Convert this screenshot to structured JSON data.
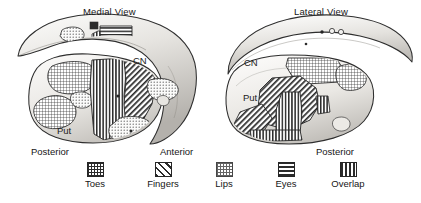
{
  "figure": {
    "type": "anatomical-diagram"
  },
  "views": [
    {
      "id": "medial",
      "title": "Medial View",
      "structures": [
        {
          "abbr": "CN",
          "name": "Caudate Nucleus"
        },
        {
          "abbr": "Put",
          "name": "Putamen"
        }
      ],
      "orientation": {
        "left": "Posterior",
        "right": "Anterior"
      }
    },
    {
      "id": "lateral",
      "title": "Lateral View",
      "structures": [
        {
          "abbr": "CN",
          "name": "Caudate Nucleus"
        },
        {
          "abbr": "Put",
          "name": "Putamen"
        }
      ],
      "orientation": {
        "right": "Posterior"
      }
    }
  ],
  "orientation_labels": {
    "posterior_left": "Posterior",
    "anterior": "Anterior",
    "posterior_right": "Posterior"
  },
  "legend": {
    "items": [
      {
        "key": "toes",
        "label": "Toes",
        "pattern": "grid",
        "swatch_class": "sw-grid"
      },
      {
        "key": "fingers",
        "label": "Fingers",
        "pattern": "diagonal",
        "swatch_class": "sw-diag"
      },
      {
        "key": "lips",
        "label": "Lips",
        "pattern": "fine-dots",
        "swatch_class": "sw-dots"
      },
      {
        "key": "eyes",
        "label": "Eyes",
        "pattern": "horizontal",
        "swatch_class": "sw-horiz"
      },
      {
        "key": "overlap",
        "label": "Overlap",
        "pattern": "vertical",
        "swatch_class": "sw-vert"
      }
    ]
  },
  "colors": {
    "ink": "#1a1a1a",
    "outline": "#262626",
    "pattern": "#2b2b2b",
    "tissue_light": "#f2f1ef",
    "tissue_mid": "#d9d7d3",
    "tissue_dark": "#b9b6b1",
    "background": "#ffffff"
  }
}
